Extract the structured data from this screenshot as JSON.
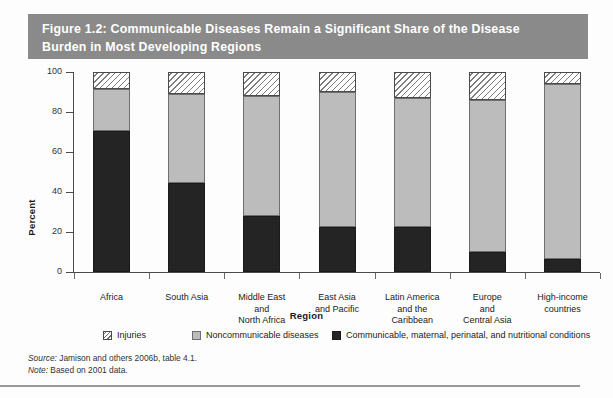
{
  "figure": {
    "title_line1": "Figure 1.2:  Communicable Diseases Remain a Significant Share of the Disease",
    "title_line2": "Burden in Most Developing Regions",
    "banner_color": "#8a8a8a",
    "source": "Jamison and others 2006b, table 4.1.",
    "source_label": "Source:",
    "note": "Based on 2001 data.",
    "note_label": "Note:"
  },
  "chart_data": {
    "type": "bar",
    "stacked": true,
    "title": "Figure 1.2:  Communicable Diseases Remain a Significant Share of the Disease Burden in Most Developing Regions",
    "xlabel": "Region",
    "ylabel": "Percent",
    "ylim": [
      0,
      100
    ],
    "yticks": [
      0,
      20,
      40,
      60,
      80,
      100
    ],
    "ytick_labels": [
      "0",
      "20",
      "40",
      "60",
      "80",
      "100"
    ],
    "grid": false,
    "legend_position": "bottom",
    "categories": [
      "Africa",
      "South Asia",
      "Middle East and North Africa",
      "East Asia and Pacific",
      "Latin America and the Caribbean",
      "Europe and Central Asia",
      "High-income countries"
    ],
    "category_lines": [
      [
        "Africa"
      ],
      [
        "South Asia"
      ],
      [
        "Middle East",
        "and",
        "North Africa"
      ],
      [
        "East Asia",
        "and Pacific"
      ],
      [
        "Latin America",
        "and the",
        "Caribbean"
      ],
      [
        "Europe",
        "and",
        "Central Asia"
      ],
      [
        "High-income",
        "countries"
      ]
    ],
    "series": [
      {
        "name": "Communicable, maternal, perinatal, and nutritional conditions",
        "fill": "dark",
        "color": "#242424",
        "values": [
          70.5,
          44.5,
          28.0,
          22.5,
          22.5,
          10.0,
          6.5
        ]
      },
      {
        "name": "Noncommunicable diseases",
        "fill": "gray",
        "color": "#bcbcbc",
        "values": [
          21.0,
          44.5,
          60.0,
          67.5,
          64.5,
          76.0,
          87.5
        ]
      },
      {
        "name": "Injuries",
        "fill": "hatched",
        "color": "#ffffff",
        "values": [
          8.5,
          11.0,
          12.0,
          10.0,
          13.0,
          14.0,
          6.0
        ]
      }
    ],
    "segment_tops": {
      "dark": [
        70.5,
        44.5,
        28.0,
        22.5,
        22.5,
        10.0,
        6.5
      ],
      "gray": [
        91.5,
        89.0,
        88.0,
        90.0,
        87.0,
        86.0,
        94.0
      ],
      "hatched": [
        100,
        100,
        100,
        100,
        100,
        100,
        100
      ]
    }
  },
  "legend": [
    {
      "label": "Injuries",
      "fill": "hatch"
    },
    {
      "label": "Noncommunicable diseases",
      "fill": "gray"
    },
    {
      "label": "Communicable, maternal, perinatal, and nutritional conditions",
      "fill": "dark"
    }
  ]
}
